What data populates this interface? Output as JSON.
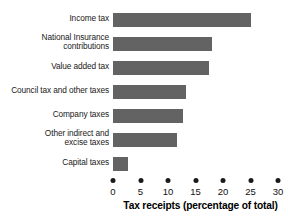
{
  "chart_data": {
    "type": "bar",
    "orientation": "horizontal",
    "title": "",
    "xlabel": "Tax receipts (percentage of total)",
    "ylabel": "",
    "xlim": [
      0,
      30
    ],
    "xticks": [
      0,
      5,
      10,
      15,
      20,
      25,
      30
    ],
    "xtick_labels": [
      "0",
      "5",
      "10",
      "15",
      "20",
      "25",
      "30"
    ],
    "grid": false,
    "legend": false,
    "bar_color": "#636363",
    "text_color": "#1a1a1a",
    "background": "#ffffff",
    "categories": [
      "Income tax",
      "National Insurance contributions",
      "Value added tax",
      "Council tax and other taxes",
      "Company taxes",
      "Other indirect and excise taxes",
      "Capital taxes"
    ],
    "values": [
      25.0,
      18.0,
      17.5,
      13.3,
      12.7,
      11.6,
      2.7
    ],
    "bars": [
      {
        "label_line1": "Income tax",
        "label_line2": "",
        "value": 25.0
      },
      {
        "label_line1": "National Insurance",
        "label_line2": "contributions",
        "value": 18.0
      },
      {
        "label_line1": "Value added tax",
        "label_line2": "",
        "value": 17.5
      },
      {
        "label_line1": "Council tax and other taxes",
        "label_line2": "",
        "value": 13.3
      },
      {
        "label_line1": "Company taxes",
        "label_line2": "",
        "value": 12.7
      },
      {
        "label_line1": "Other indirect and",
        "label_line2": "excise taxes",
        "value": 11.6
      },
      {
        "label_line1": "Capital taxes",
        "label_line2": "",
        "value": 2.7
      }
    ]
  }
}
